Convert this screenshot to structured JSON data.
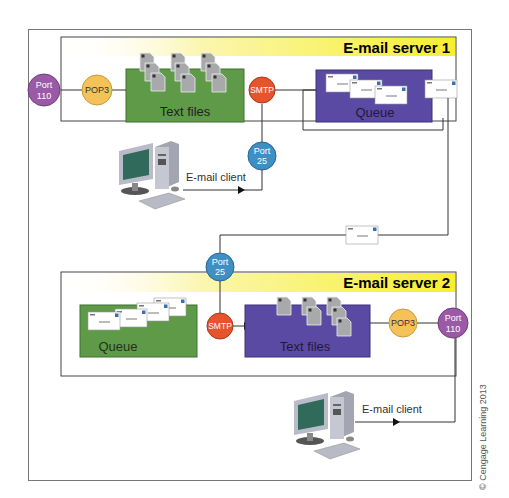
{
  "server1": {
    "title": "E-mail server 1",
    "port_left": {
      "line1": "Port",
      "line2": "110"
    },
    "pop3": "POP3",
    "text_files": "Text files",
    "smtp": "SMTP",
    "queue": "Queue",
    "port_bottom": {
      "line1": "Port",
      "line2": "25"
    }
  },
  "client1": {
    "label": "E-mail client"
  },
  "server2": {
    "title": "E-mail server 2",
    "port_top": {
      "line1": "Port",
      "line2": "25"
    },
    "queue": "Queue",
    "smtp": "SMTP",
    "text_files": "Text files",
    "pop3": "POP3",
    "port_right": {
      "line1": "Port",
      "line2": "110"
    }
  },
  "client2": {
    "label": "E-mail client"
  },
  "copyright": "© Cengage Learning 2013",
  "colors": {
    "port_purple": "#9a5aa6",
    "pop3_yellow": "#f5c25a",
    "smtp_red": "#e5542c",
    "port_blue": "#3f8ec4",
    "green_box": "#5f9a48",
    "purple_box": "#5b4aa3",
    "title_yellow": "#f7ef3a"
  }
}
